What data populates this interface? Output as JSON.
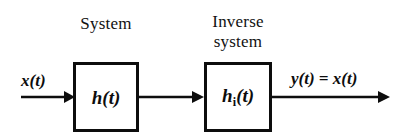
{
  "figure": {
    "type": "block-diagram",
    "background_color": "#ffffff",
    "line_color": "#0d0d0d"
  },
  "captions": {
    "system": "System",
    "inverse_system": "Inverse\nsystem"
  },
  "blocks": [
    {
      "id": "h",
      "label_main": "h",
      "label_subscript": "",
      "label_suffix": "(t)",
      "caption": "System"
    },
    {
      "id": "hi",
      "label_main": "h",
      "label_subscript": "i",
      "label_suffix": "(t)",
      "caption": "Inverse system"
    }
  ],
  "signals": {
    "input": "x(t)",
    "output": "y(t) = x(t)"
  },
  "arrows": [
    {
      "id": "input-arrow",
      "from": "source",
      "to": "h-block"
    },
    {
      "id": "middle-arrow",
      "from": "h-block",
      "to": "hi-block"
    },
    {
      "id": "output-arrow",
      "from": "hi-block",
      "to": "sink"
    }
  ]
}
